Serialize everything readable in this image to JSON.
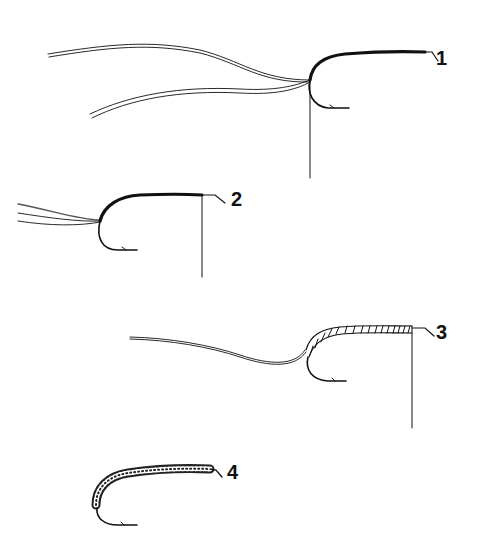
{
  "diagram": {
    "ink_color": "#111111",
    "steps": [
      {
        "number": "1",
        "label_pos": [
          436,
          48
        ]
      },
      {
        "number": "2",
        "label_pos": [
          231,
          189
        ]
      },
      {
        "number": "3",
        "label_pos": [
          436,
          322
        ]
      },
      {
        "number": "4",
        "label_pos": [
          227,
          462
        ]
      }
    ]
  }
}
